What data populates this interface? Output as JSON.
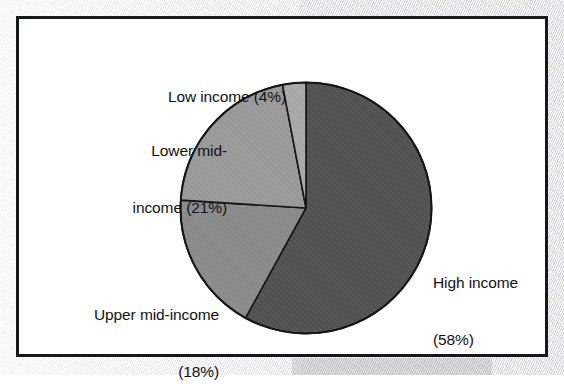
{
  "figure": {
    "background_color": "#ffffff",
    "frame_color": "#16181a",
    "page_background_color": "#ececed"
  },
  "chart_data": {
    "type": "pie",
    "title": "",
    "subtitle": "",
    "xlabel": "",
    "ylabel": "",
    "legend_position": "none",
    "grid": false,
    "units": "percent",
    "total": 101,
    "start_angle_deg": 0,
    "direction": "clockwise",
    "categories": [
      "High income",
      "Upper mid-income",
      "Lower mid-income",
      "Low income"
    ],
    "values": [
      58,
      18,
      21,
      4
    ],
    "labels": [
      "High income (58%)",
      "Upper mid-income (18%)",
      "Lower mid-income (21%)",
      "Low income (4%)"
    ],
    "colors": [
      "#565656",
      "#8d8d8d",
      "#9c9c9c",
      "#ababab"
    ],
    "slices": [
      {
        "name": "High income",
        "value": 58,
        "label_line1": "High income",
        "label_line2": "(58%)",
        "color": "#565656",
        "start_deg": 0.0,
        "end_deg": 208.8
      },
      {
        "name": "Upper mid-income",
        "value": 18,
        "label_line1": "Upper mid-income",
        "label_line2": "(18%)",
        "color": "#8d8d8d",
        "start_deg": 208.8,
        "end_deg": 273.6
      },
      {
        "name": "Lower mid-income",
        "value": 21,
        "label_line1": "Lower mid-",
        "label_line2": "income (21%)",
        "color": "#9c9c9c",
        "start_deg": 273.6,
        "end_deg": 349.2
      },
      {
        "name": "Low income",
        "value": 4,
        "label_line1": "Low income (4%)",
        "label_line2": "",
        "color": "#ababab",
        "start_deg": 349.2,
        "end_deg": 360.0
      }
    ]
  },
  "labels": {
    "low_income": "Low income (4%)",
    "lower_mid_line1": "Lower mid-",
    "lower_mid_line2": "income (21%)",
    "upper_mid_line1": "Upper mid-income",
    "upper_mid_line2": "(18%)",
    "high_income_line1": "High income",
    "high_income_line2": "(58%)"
  }
}
